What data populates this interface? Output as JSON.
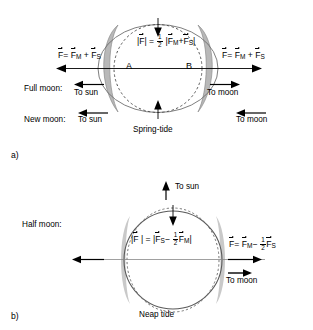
{
  "figure": {
    "title_a_caption": "Spring-tide",
    "title_b_caption": "Neap tide"
  },
  "panel_a": {
    "tag": "a)",
    "caption": "Spring-tide",
    "point_label_left": "A",
    "point_label_right": "B",
    "center_formula": {
      "lhs_bar_open": "|",
      "lhs_vec": "F",
      "lhs_bar_close": "|",
      "equals": "=",
      "frac_num": "1",
      "frac_den": "2",
      "rhs_bar_open": "|",
      "rhs_vec1": "F",
      "rhs_vec1_sub": "M",
      "plus": "+",
      "rhs_vec2": "F",
      "rhs_vec2_sub": "S",
      "rhs_bar_close": "|",
      "plain": "|F| = 1/2 |F_M + F_S|"
    },
    "left_force_label": {
      "vec": "F",
      "equals": "=",
      "term1": "F",
      "term1_sub": "M",
      "plus": "+",
      "term2": "F",
      "term2_sub": "S",
      "plain": "F = F_M + F_S"
    },
    "right_force_label": {
      "vec": "F",
      "equals": "=",
      "term1": "F",
      "term1_sub": "M",
      "plus": "+",
      "term2": "F",
      "term2_sub": "S",
      "plain": "F = F_M + F_S"
    },
    "rows": [
      {
        "row_label": "Full moon:",
        "left_direction": "To sun",
        "left_arrow": "arrow-left-icon",
        "right_direction": "To moon",
        "right_arrow": "arrow-right-icon"
      },
      {
        "row_label": "New moon:",
        "left_direction": "To sun",
        "left_arrow": "arrow-left-icon",
        "right_direction": "To moon",
        "right_arrow": "arrow-left-icon"
      }
    ]
  },
  "panel_b": {
    "tag": "b)",
    "caption": "Neap tide",
    "row_label": "Half moon:",
    "to_sun_label": "To sun",
    "to_sun_arrow": "arrow-up-icon",
    "to_moon_label": "To moon",
    "to_moon_arrow": "arrow-right-icon",
    "center_formula": {
      "lhs_bar_open": "|",
      "lhs_vec": "F",
      "lhs_bar_close": "|",
      "equals": "=",
      "rhs_bar_open": "|",
      "rhs_vec1": "F",
      "rhs_vec1_sub": "S",
      "minus": "−",
      "frac_num": "1",
      "frac_den": "2",
      "rhs_vec2": "F",
      "rhs_vec2_sub": "M",
      "rhs_bar_close": "|",
      "plain": "|F| = |F_S - 1/2 F_M|"
    },
    "right_force_label": {
      "vec": "F",
      "equals": "=",
      "term1": "F",
      "term1_sub": "M",
      "minus": "−",
      "frac_num": "1",
      "frac_den": "2",
      "term2": "F",
      "term2_sub": "S",
      "plain": "F = F_M - 1/2 F_S"
    }
  },
  "colors": {
    "stroke": "#000000",
    "bulge_fill": "#b8b8b8",
    "bulge_fill_b": "#c9c9c9",
    "background": "#ffffff"
  }
}
